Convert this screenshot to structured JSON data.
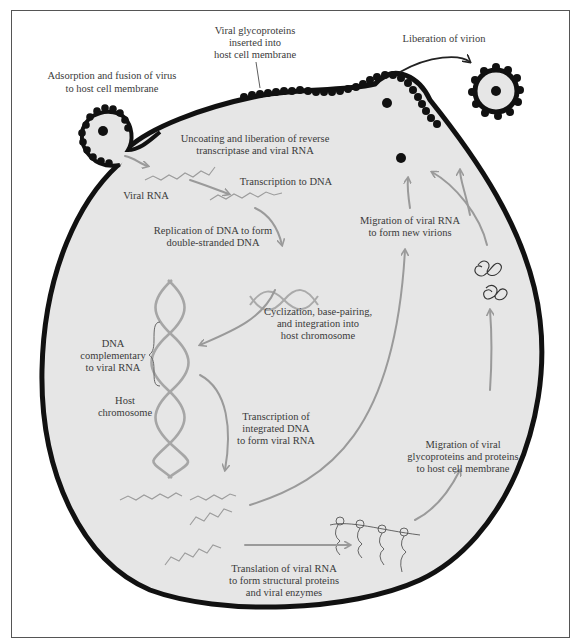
{
  "colors": {
    "background": "#ffffff",
    "frame": "#555555",
    "cell_fill": "#e6e6e6",
    "membrane": "#111111",
    "arrow": "#9a9a9a",
    "text": "#3a3a3a"
  },
  "labels": {
    "adsorption": [
      "Adsorption and fusion of virus",
      "to host cell membrane"
    ],
    "glycoproteins_inserted": [
      "Viral glycoproteins",
      "inserted into",
      "host cell membrane"
    ],
    "liberation": [
      "Liberation of virion"
    ],
    "uncoating": [
      "Uncoating and liberation of reverse",
      "transcriptase and viral RNA"
    ],
    "viral_rna": [
      "Viral RNA"
    ],
    "transcription_dna": [
      "Transcription to DNA"
    ],
    "replication": [
      "Replication of DNA to form",
      "double-stranded DNA"
    ],
    "cyclization": [
      "Cyclization, base-pairing,",
      "and integration into",
      "host chromosome"
    ],
    "dna_complementary": [
      "DNA",
      "complementary",
      "to viral RNA"
    ],
    "host_chromosome": [
      "Host",
      "chromosome"
    ],
    "transcription_integrated": [
      "Transcription of",
      "integrated DNA",
      "to form viral RNA"
    ],
    "migration_rna": [
      "Migration of viral RNA",
      "to form new virions"
    ],
    "migration_glyco": [
      "Migration of viral",
      "glycoproteins and proteins",
      "to host cell membrane"
    ],
    "translation": [
      "Translation of viral RNA",
      "to form structural proteins",
      "and viral enzymes"
    ]
  }
}
